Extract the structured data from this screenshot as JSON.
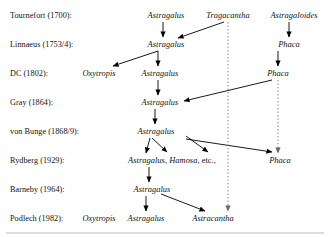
{
  "diagram": {
    "background_color": "#ffffff",
    "text_color": "#111111",
    "line_color": "#000000",
    "dotted_line_color": "#777777",
    "rows": [
      {
        "id": "tournefort",
        "label": "Tournefort (1700):",
        "y": 15
      },
      {
        "id": "linnaeus",
        "label": "Linnaeus (1753/4):",
        "y": 44
      },
      {
        "id": "dc",
        "label": "DC (1802):",
        "y": 73
      },
      {
        "id": "gray",
        "label": "Gray (1864):",
        "y": 102
      },
      {
        "id": "vonbunge",
        "label": "von Bunge (1868/9):",
        "y": 131
      },
      {
        "id": "rydberg",
        "label": "Rydberg (1929):",
        "y": 160
      },
      {
        "id": "barneby",
        "label": "Barneby (1964):",
        "y": 189
      },
      {
        "id": "podlech",
        "label": "Podlech (1982):",
        "y": 218
      }
    ],
    "label_x": 10,
    "nodes": [
      {
        "id": "t-astragalus",
        "row": "tournefort",
        "text": "Astragalus",
        "x": 166,
        "y": 15
      },
      {
        "id": "t-tragacantha",
        "row": "tournefort",
        "text": "Tragacantha",
        "x": 228,
        "y": 15
      },
      {
        "id": "t-astragaloides",
        "row": "tournefort",
        "text": "Astragaloides",
        "x": 294,
        "y": 15
      },
      {
        "id": "l-astragalus",
        "row": "linnaeus",
        "text": "Astragalus",
        "x": 166,
        "y": 44
      },
      {
        "id": "l-phaca",
        "row": "linnaeus",
        "text": "Phaca",
        "x": 289,
        "y": 44
      },
      {
        "id": "d-oxytropis",
        "row": "dc",
        "text": "Oxytropis",
        "x": 99,
        "y": 73
      },
      {
        "id": "d-astragalus",
        "row": "dc",
        "text": "Astragalus",
        "x": 160,
        "y": 73
      },
      {
        "id": "d-phaca",
        "row": "dc",
        "text": "Phaca",
        "x": 278,
        "y": 73
      },
      {
        "id": "g-astragalus",
        "row": "gray",
        "text": "Astragalus",
        "x": 160,
        "y": 102
      },
      {
        "id": "b-astragalus",
        "row": "vonbunge",
        "text": "Astragalus",
        "x": 156,
        "y": 131
      },
      {
        "id": "r-astragalus",
        "row": "rydberg",
        "text": "Astragalus, Hamosa, etc.,",
        "x": 172,
        "y": 160,
        "mixed": true
      },
      {
        "id": "r-phaca",
        "row": "rydberg",
        "text": "Phaca",
        "x": 280,
        "y": 160
      },
      {
        "id": "bn-astragalus",
        "row": "barneby",
        "text": "Astragalus",
        "x": 152,
        "y": 189
      },
      {
        "id": "p-oxytropis",
        "row": "podlech",
        "text": "Oxytropis",
        "x": 99,
        "y": 218
      },
      {
        "id": "p-astragalus",
        "row": "podlech",
        "text": "Astragalus",
        "x": 146,
        "y": 218
      },
      {
        "id": "p-astracantha",
        "row": "podlech",
        "text": "Astracantha",
        "x": 213,
        "y": 218
      }
    ],
    "solid_arrows": [
      {
        "from": "t-astragalus",
        "to": "l-astragalus",
        "x1": 163,
        "y1": 22,
        "x2": 163,
        "y2": 37
      },
      {
        "from": "t-tragacantha",
        "to": "l-astragalus",
        "x1": 224,
        "y1": 22,
        "x2": 178,
        "y2": 38
      },
      {
        "from": "l-astragalus",
        "to": "d-oxytropis",
        "x1": 158,
        "y1": 51,
        "x2": 113,
        "y2": 66
      },
      {
        "from": "l-astragalus",
        "to": "d-astragalus",
        "x1": 158,
        "y1": 51,
        "x2": 158,
        "y2": 66
      },
      {
        "from": "d-astragalus",
        "to": "g-astragalus",
        "x1": 158,
        "y1": 80,
        "x2": 158,
        "y2": 95
      },
      {
        "from": "d-phaca",
        "to": "g-astragalus",
        "x1": 272,
        "y1": 80,
        "x2": 184,
        "y2": 101
      },
      {
        "from": "g-astragalus",
        "to": "b-astragalus",
        "x1": 155,
        "y1": 109,
        "x2": 155,
        "y2": 124
      },
      {
        "from": "b-astragalus",
        "to": "r-astragalus-a",
        "x1": 150,
        "y1": 138,
        "x2": 146,
        "y2": 153
      },
      {
        "from": "b-astragalus",
        "to": "r-astragalus-b",
        "x1": 152,
        "y1": 138,
        "x2": 167,
        "y2": 152
      },
      {
        "from": "b-astragalus",
        "to": "r-astragalus-c",
        "x1": 186,
        "y1": 136,
        "x2": 208,
        "y2": 152
      },
      {
        "from": "b-astragalus",
        "to": "r-phaca",
        "x1": 186,
        "y1": 139,
        "x2": 272,
        "y2": 152
      },
      {
        "from": "r-astragalus",
        "to": "bn-astragalus",
        "x1": 149,
        "y1": 167,
        "x2": 149,
        "y2": 182
      },
      {
        "from": "bn-astragalus",
        "to": "p-astragalus",
        "x1": 146,
        "y1": 196,
        "x2": 146,
        "y2": 211
      },
      {
        "from": "bn-astragalus",
        "to": "p-astracantha",
        "x1": 161,
        "y1": 194,
        "x2": 205,
        "y2": 211
      }
    ],
    "dotted_arrows": [
      {
        "from": "t-astragaloides",
        "to": "l-phaca",
        "x": 289,
        "y1": 22,
        "y2": 37,
        "style": "solid"
      },
      {
        "from": "l-phaca",
        "to": "d-phaca",
        "x": 278,
        "y1": 51,
        "y2": 66,
        "style": "solid"
      },
      {
        "from": "t-tragacantha",
        "to": "p-astracantha",
        "x": 228,
        "y1": 22,
        "y2": 211,
        "style": "dotted"
      },
      {
        "from": "d-phaca",
        "to": "r-phaca",
        "x": 278,
        "y1": 80,
        "y2": 153,
        "style": "dotted"
      }
    ],
    "bottom_rule": {
      "x1": 6,
      "x2": 324,
      "y": 233
    }
  }
}
